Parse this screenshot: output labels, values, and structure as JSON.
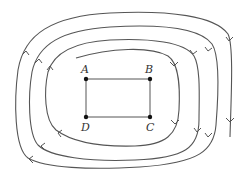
{
  "diagram": {
    "colors": {
      "background": "#ffffff",
      "line": "#555555",
      "point": "#111111",
      "label": "#333333"
    },
    "points": [
      {
        "label": "A",
        "x": 86,
        "y": 79,
        "label_x": 81,
        "label_y": 73
      },
      {
        "label": "B",
        "x": 150,
        "y": 79,
        "label_x": 145,
        "label_y": 73
      },
      {
        "label": "C",
        "x": 150,
        "y": 117,
        "label_x": 146,
        "label_y": 131
      },
      {
        "label": "D",
        "x": 86,
        "y": 117,
        "label_x": 81,
        "label_y": 131
      }
    ],
    "rectangle": [
      "A",
      "B",
      "C",
      "D"
    ],
    "spiral": {
      "direction": "clockwise",
      "turns": 4
    }
  }
}
